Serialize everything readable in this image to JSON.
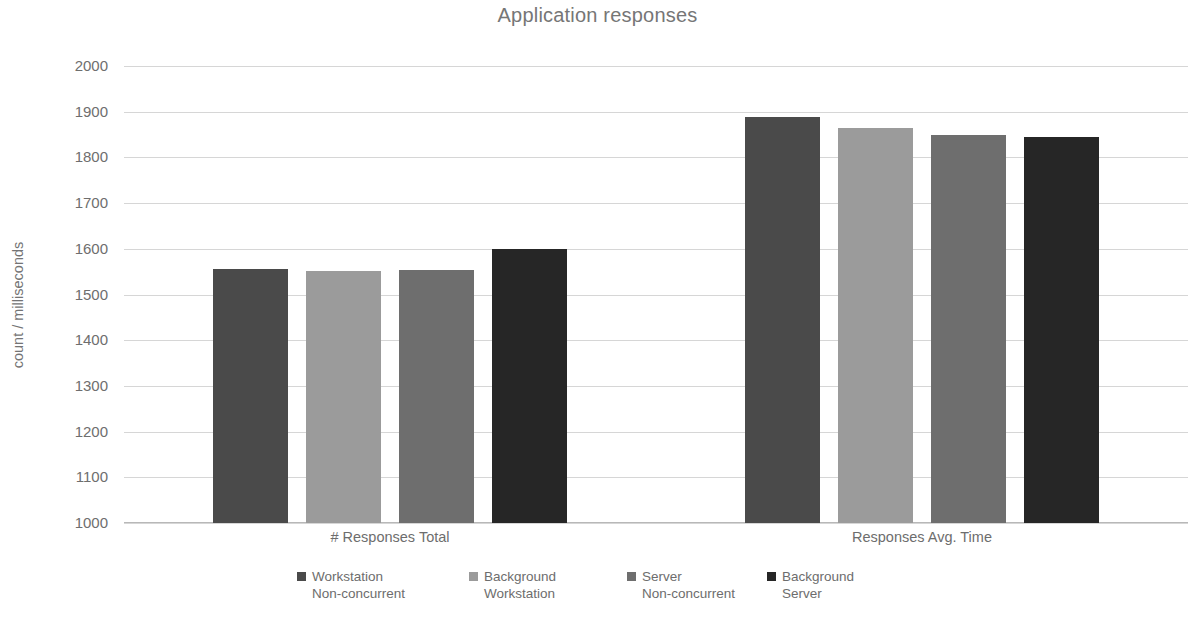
{
  "chart_data": {
    "type": "bar",
    "title": "Application responses",
    "xlabel": "",
    "ylabel": "count / milliseconds",
    "ylim": [
      1000,
      2000
    ],
    "ytick_step": 100,
    "yticks": [
      "2000",
      "1900",
      "1800",
      "1700",
      "1600",
      "1500",
      "1400",
      "1300",
      "1200",
      "1100",
      "1000"
    ],
    "grid": true,
    "legend_position": "bottom",
    "categories": [
      "# Responses Total",
      "Responses Avg. Time"
    ],
    "series": [
      {
        "name": "Workstation Non-concurrent",
        "name_line1": "Workstation",
        "name_line2": "Non-concurrent",
        "color": "#4a4a4a",
        "values": [
          1555,
          1888
        ]
      },
      {
        "name": "Background Workstation",
        "name_line1": "Background",
        "name_line2": "Workstation",
        "color": "#9b9b9b",
        "values": [
          1552,
          1865
        ]
      },
      {
        "name": "Server Non-concurrent",
        "name_line1": "Server",
        "name_line2": "Non-concurrent",
        "color": "#6e6e6e",
        "values": [
          1553,
          1850
        ]
      },
      {
        "name": "Background Server",
        "name_line1": "Background",
        "name_line2": "Server",
        "color": "#262626",
        "values": [
          1600,
          1845
        ]
      }
    ]
  },
  "colors": {
    "background": "#ffffff",
    "gridline": "#d6d6d6",
    "axis": "#b8b8b8",
    "text": "#6d6d6d",
    "title_text": "#767676"
  }
}
